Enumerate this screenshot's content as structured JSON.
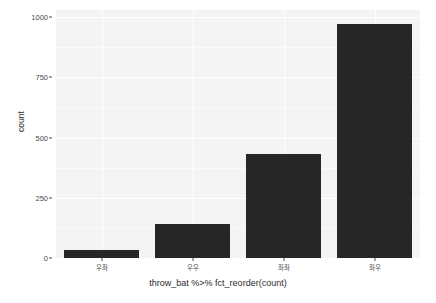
{
  "chart_data": {
    "type": "bar",
    "title": "",
    "subtitle": "",
    "xlabel": "throw_bat %>% fct_reorder(count)",
    "ylabel": "count",
    "categories": [
      "우좌",
      "우우",
      "좌좌",
      "좌우"
    ],
    "values": [
      35,
      140,
      430,
      970
    ],
    "ylim": [
      0,
      1030
    ],
    "yticks": [
      0,
      250,
      500,
      750,
      1000
    ],
    "ytick_labels": [
      "0",
      "250",
      "500",
      "750",
      "1000"
    ],
    "grid": "horizontal-and-vertical-white-on-grey",
    "legend": "none",
    "bar_color": "#262626",
    "panel_background": "#f4f4f4",
    "gridline_color": "#ffffff",
    "axis_text_color": "#4d4d4d",
    "axis_title_color": "#2b2b2b"
  }
}
